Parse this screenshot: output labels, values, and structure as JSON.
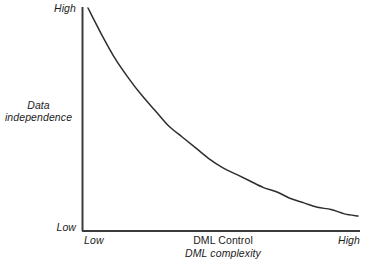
{
  "chart_data": {
    "type": "line",
    "title": "",
    "subtitle": "",
    "xlabel": "DML Control",
    "xlabel_secondary": "DML complexity",
    "ylabel": "Data independence",
    "ylabel_lines": [
      "Data",
      "independence"
    ],
    "x_tick_labels": [
      "Low",
      "High"
    ],
    "y_tick_labels": [
      "Low",
      "High"
    ],
    "xlim": [
      0,
      1
    ],
    "ylim": [
      0,
      1
    ],
    "grid": false,
    "legend": null,
    "annotations": [],
    "series": [
      {
        "name": "Data independence vs DML control",
        "shape": "exponential-decay",
        "x": [
          0.0,
          0.05,
          0.1,
          0.15,
          0.2,
          0.25,
          0.3,
          0.35,
          0.4,
          0.45,
          0.5,
          0.55,
          0.6,
          0.65,
          0.7,
          0.75,
          0.8,
          0.85,
          0.9,
          0.95,
          1.0
        ],
        "y": [
          1.0,
          0.88,
          0.77,
          0.68,
          0.6,
          0.53,
          0.46,
          0.41,
          0.36,
          0.31,
          0.27,
          0.24,
          0.21,
          0.18,
          0.16,
          0.13,
          0.11,
          0.09,
          0.08,
          0.06,
          0.05
        ],
        "color": "#2e2e2e",
        "linewidth": 1.5
      }
    ]
  },
  "axes": {
    "y_high": "High",
    "y_low": "Low",
    "x_low": "Low",
    "x_high": "High",
    "y_title_line1": "Data",
    "y_title_line2": "independence",
    "x_title_line1": "DML Control",
    "x_title_line2": "DML complexity"
  },
  "colors": {
    "background": "#ffffff",
    "axis": "#3a3a3a",
    "curve": "#2e2e2e",
    "text": "#1c1c1c"
  }
}
